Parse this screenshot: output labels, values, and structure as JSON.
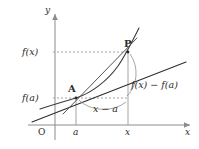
{
  "figure": {
    "axes": {
      "x_axis_label": "x",
      "y_axis_label": "y",
      "origin_label": "O"
    },
    "ticks": {
      "x": [
        {
          "label": "a"
        },
        {
          "label": "x"
        }
      ],
      "y": [
        {
          "label": "f(a)"
        },
        {
          "label": "f(x)"
        }
      ]
    },
    "points": [
      {
        "label": "A"
      },
      {
        "label": "P"
      }
    ],
    "annotations": [
      {
        "label": "x − a"
      },
      {
        "label": "f(x) − f(a)"
      }
    ],
    "colors": {
      "axis": "#8c8c8c",
      "curve": "#3a3a3a",
      "secant": "#2e2e2e",
      "tangent": "#5a5a5a",
      "dashed": "#9a9a9a",
      "arc": "#8f8f8f",
      "text": "#2b2b2b",
      "background": "#ffffff"
    }
  }
}
